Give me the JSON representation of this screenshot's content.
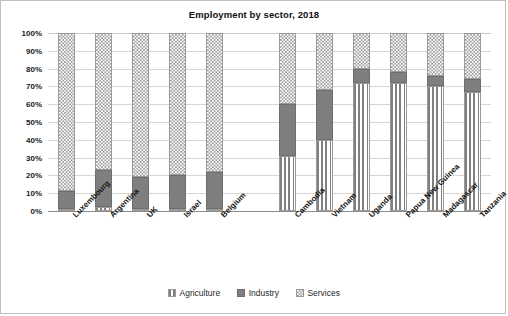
{
  "chart_data": {
    "type": "bar",
    "subtype": "stacked-percentage-column",
    "title": "Employment by sector, 2018",
    "xlabel": "",
    "ylabel": "",
    "ylim": [
      0,
      100
    ],
    "ytick_labels": [
      "0%",
      "10%",
      "20%",
      "30%",
      "40%",
      "50%",
      "60%",
      "70%",
      "80%",
      "90%",
      "100%"
    ],
    "ytick_values": [
      0,
      10,
      20,
      30,
      40,
      50,
      60,
      70,
      80,
      90,
      100
    ],
    "grid": true,
    "legend_position": "bottom",
    "categories": [
      "Luxembourg",
      "Argentina",
      "UK",
      "Israel",
      "Belgium",
      "",
      "Cambodia",
      "Vietnam",
      "Uganda",
      "Papua New Guinea",
      "Madagascar",
      "Tanzania"
    ],
    "series": [
      {
        "name": "Agriculture",
        "pattern": "vertical-lines",
        "color": "#ffffff",
        "values": [
          1,
          2,
          1,
          1,
          1,
          null,
          31,
          40,
          72,
          72,
          70,
          67
        ]
      },
      {
        "name": "Industry",
        "pattern": "solid",
        "color": "#7f7f7f",
        "values": [
          10,
          21,
          18,
          19,
          21,
          null,
          29,
          28,
          8,
          6,
          6,
          7
        ]
      },
      {
        "name": "Services",
        "pattern": "checker",
        "color": "#ffffff",
        "values": [
          89,
          77,
          81,
          80,
          78,
          null,
          40,
          32,
          20,
          22,
          24,
          26
        ]
      }
    ],
    "cumulative_tops": {
      "Luxembourg": {
        "agriculture": 1,
        "industry": 11,
        "services": 100
      },
      "Argentina": {
        "agriculture": 2,
        "industry": 23,
        "services": 100
      },
      "UK": {
        "agriculture": 1,
        "industry": 19,
        "services": 100
      },
      "Israel": {
        "agriculture": 1,
        "industry": 20,
        "services": 100
      },
      "Belgium": {
        "agriculture": 1,
        "industry": 22,
        "services": 100
      },
      "Cambodia": {
        "agriculture": 31,
        "industry": 60,
        "services": 100
      },
      "Vietnam": {
        "agriculture": 40,
        "industry": 68,
        "services": 100
      },
      "Uganda": {
        "agriculture": 72,
        "industry": 80,
        "services": 100
      },
      "Papua New Guinea": {
        "agriculture": 72,
        "industry": 78,
        "services": 100
      },
      "Madagascar": {
        "agriculture": 70,
        "industry": 76,
        "services": 100
      },
      "Tanzania": {
        "agriculture": 67,
        "industry": 74,
        "services": 100
      }
    },
    "legend": [
      {
        "label": "Agriculture",
        "icon": "agriculture-swatch"
      },
      {
        "label": "Industry",
        "icon": "industry-swatch"
      },
      {
        "label": "Services",
        "icon": "services-swatch"
      }
    ]
  }
}
